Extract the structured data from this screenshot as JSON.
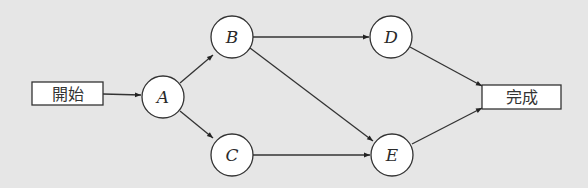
{
  "diagram": {
    "type": "flow-network",
    "background": "#e6e6e6",
    "start": {
      "label": "開始",
      "x": 32,
      "y": 82,
      "w": 71,
      "h": 23
    },
    "end": {
      "label": "完成",
      "x": 482,
      "y": 85,
      "w": 79,
      "h": 24
    },
    "nodes": [
      {
        "id": "A",
        "label": "A",
        "cx": 163,
        "cy": 97,
        "r": 21
      },
      {
        "id": "B",
        "label": "B",
        "cx": 232,
        "cy": 37,
        "r": 21
      },
      {
        "id": "C",
        "label": "C",
        "cx": 232,
        "cy": 155,
        "r": 21
      },
      {
        "id": "D",
        "label": "D",
        "cx": 391,
        "cy": 37,
        "r": 21
      },
      {
        "id": "E",
        "label": "E",
        "cx": 392,
        "cy": 155,
        "r": 21
      }
    ],
    "edges": [
      {
        "from": "開始",
        "to": "A"
      },
      {
        "from": "A",
        "to": "B"
      },
      {
        "from": "A",
        "to": "C"
      },
      {
        "from": "B",
        "to": "D"
      },
      {
        "from": "B",
        "to": "E"
      },
      {
        "from": "C",
        "to": "E"
      },
      {
        "from": "D",
        "to": "完成"
      },
      {
        "from": "E",
        "to": "完成"
      }
    ]
  }
}
